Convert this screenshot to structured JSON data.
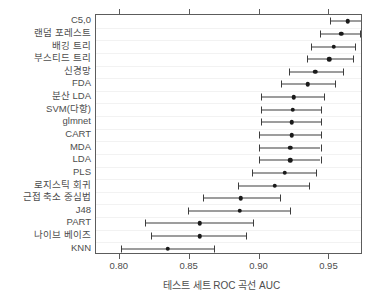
{
  "chart_data": {
    "type": "scatter",
    "title": "",
    "subtitle": "",
    "xlabel": "테스트 세트 ROC 곡선 AUC",
    "ylabel": "",
    "xlim": [
      0.783,
      0.974
    ],
    "xticks": [
      0.8,
      0.85,
      0.9,
      0.95
    ],
    "xtick_labels": [
      "0.80",
      "0.85",
      "0.90",
      "0.95"
    ],
    "grid": "horizontal",
    "legend": "none",
    "orientation": "horizontal",
    "error_bars": "horizontal-confidence-interval",
    "categories": [
      "C5,0",
      "랜덤 포레스트",
      "배깅 트리",
      "부스티드 트리",
      "신경망",
      "FDA",
      "분산 LDA",
      "SVM(다항)",
      "glmnet",
      "CART",
      "MDA",
      "LDA",
      "PLS",
      "로지스틱 회귀",
      "근접 축소 중심법",
      "J48",
      "PART",
      "나이브 베이즈",
      "KNN"
    ],
    "values": [
      0.963,
      0.9586,
      0.9529,
      0.95,
      0.94,
      0.9346,
      0.9243,
      0.9236,
      0.9229,
      0.9229,
      0.9221,
      0.9221,
      0.9179,
      0.9107,
      0.8864,
      0.8857,
      0.8571,
      0.8571,
      0.8343
    ],
    "lower": [
      0.9507,
      0.9429,
      0.9371,
      0.9336,
      0.9214,
      0.915,
      0.9007,
      0.9007,
      0.9007,
      0.8993,
      0.8993,
      0.8993,
      0.8943,
      0.8843,
      0.8593,
      0.8486,
      0.8179,
      0.8221,
      0.8007
    ],
    "upper": [
      0.9771,
      0.9721,
      0.9686,
      0.9671,
      0.96,
      0.9543,
      0.9464,
      0.9443,
      0.9443,
      0.9443,
      0.9436,
      0.9436,
      0.9407,
      0.9357,
      0.9143,
      0.9221,
      0.895,
      0.89,
      0.8671
    ],
    "colors": {
      "point": "#1a1a1a",
      "errorbar": "#3d3d3d",
      "frame": "#5c5c5c",
      "grid": "#f2f2f2",
      "background": "#ffffff",
      "text": "#4d4d4d"
    }
  }
}
